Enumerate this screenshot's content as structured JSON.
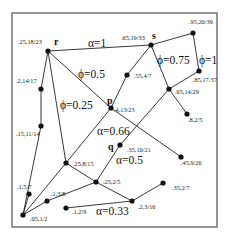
{
  "diagram": {
    "frame": {
      "x": 12,
      "y": 13,
      "width": 205,
      "height": 214
    },
    "nodes": [
      {
        "id": "r",
        "x": 48,
        "y": 51,
        "value": ".25,18/23",
        "name": "r",
        "lx": 18,
        "ly": 44
      },
      {
        "id": "s",
        "x": 151,
        "y": 45,
        "value": ".65,19/33",
        "name": "s",
        "lx": 121,
        "ly": 40
      },
      {
        "id": "n95",
        "x": 193,
        "y": 33,
        "value": ".95,20/39",
        "name": "",
        "lx": 189,
        "ly": 24
      },
      {
        "id": "n85",
        "x": 199,
        "y": 71,
        "value": ".85,17/37",
        "name": "",
        "lx": 193,
        "ly": 82
      },
      {
        "id": "n55",
        "x": 127,
        "y": 75,
        "value": ".55,4/7",
        "name": "",
        "lx": 134,
        "ly": 78
      },
      {
        "id": "n65",
        "x": 169,
        "y": 89,
        "value": ".65,14/29",
        "name": "",
        "lx": 175,
        "ly": 94
      },
      {
        "id": "n8",
        "x": 187,
        "y": 114,
        "value": ".8,2/5",
        "name": "",
        "lx": 188,
        "ly": 122
      },
      {
        "id": "p",
        "x": 111,
        "y": 108,
        "value": ".4,13/23",
        "name": "p",
        "lx": 114,
        "ly": 112
      },
      {
        "id": "n2",
        "x": 41,
        "y": 89,
        "value": ".2,14/17",
        "name": "",
        "lx": 16,
        "ly": 83
      },
      {
        "id": "n15",
        "x": 41,
        "y": 126,
        "value": ".15,11/14",
        "name": "",
        "lx": 16,
        "ly": 136
      },
      {
        "id": "q",
        "x": 120,
        "y": 145,
        "value": ".35,10/21",
        "name": "q",
        "lx": 127,
        "ly": 152
      },
      {
        "id": "n45",
        "x": 181,
        "y": 157,
        "value": ".45,9/26",
        "name": "",
        "lx": 181,
        "ly": 165
      },
      {
        "id": "n258",
        "x": 66,
        "y": 163,
        "value": ".25,8/15",
        "name": "",
        "lx": 73,
        "ly": 166
      },
      {
        "id": "n252",
        "x": 96,
        "y": 182,
        "value": ".25,2/5",
        "name": "",
        "lx": 103,
        "ly": 184
      },
      {
        "id": "n35",
        "x": 163,
        "y": 183,
        "value": ".35,2/7",
        "name": "",
        "lx": 172,
        "ly": 190
      },
      {
        "id": "n15b",
        "x": 29,
        "y": 194,
        "value": ".1,5/7",
        "name": "",
        "lx": 17,
        "ly": 189
      },
      {
        "id": "n13",
        "x": 47,
        "y": 201,
        "value": ".1,3/8",
        "name": "",
        "lx": 51,
        "ly": 196
      },
      {
        "id": "n12",
        "x": 66,
        "y": 208,
        "value": ".1,2/9",
        "name": "",
        "lx": 72,
        "ly": 214
      },
      {
        "id": "n23",
        "x": 132,
        "y": 201,
        "value": ".2,3/16",
        "name": "",
        "lx": 138,
        "ly": 209
      },
      {
        "id": "n05",
        "x": 23,
        "y": 215,
        "value": ".05,1/2",
        "name": "",
        "lx": 30,
        "ly": 221
      }
    ],
    "node_names": {
      "r": {
        "text": "r",
        "x": 54,
        "y": 45
      },
      "s": {
        "text": "s",
        "x": 152,
        "y": 39
      },
      "p": {
        "text": "p",
        "x": 107,
        "y": 104
      },
      "q": {
        "text": "q",
        "x": 108,
        "y": 150
      }
    },
    "edges": [
      [
        "r",
        "s"
      ],
      [
        "s",
        "n95"
      ],
      [
        "n95",
        "n85"
      ],
      [
        "n85",
        "n65"
      ],
      [
        "s",
        "n65"
      ],
      [
        "n65",
        "n8"
      ],
      [
        "s",
        "n55"
      ],
      [
        "n55",
        "p"
      ],
      [
        "p",
        "n258"
      ],
      [
        "n258",
        "n05"
      ],
      [
        "r",
        "p"
      ],
      [
        "p",
        "n45"
      ],
      [
        "r",
        "n2"
      ],
      [
        "n2",
        "n15"
      ],
      [
        "n15",
        "n05"
      ],
      [
        "r",
        "n258"
      ],
      [
        "n65",
        "q"
      ],
      [
        "q",
        "n252"
      ],
      [
        "n252",
        "n13"
      ],
      [
        "n13",
        "n05"
      ],
      [
        "n258",
        "n252"
      ],
      [
        "n252",
        "n23"
      ],
      [
        "n23",
        "n35"
      ],
      [
        "n12",
        "n23"
      ],
      [
        "n05",
        "n15b"
      ]
    ],
    "edge_labels": [
      {
        "text": "α=1",
        "x": 88,
        "y": 47
      },
      {
        "text": "ϕ=0.5",
        "x": 78,
        "y": 78
      },
      {
        "text": "ϕ=0.25",
        "x": 60,
        "y": 109
      },
      {
        "text": "ϕ=0.75",
        "x": 157,
        "y": 64
      },
      {
        "text": "ϕ=1",
        "x": 199,
        "y": 64
      },
      {
        "text": "α=0.66",
        "x": 97,
        "y": 135
      },
      {
        "text": "α=0.5",
        "x": 116,
        "y": 164
      },
      {
        "text": "α=0.33",
        "x": 96,
        "y": 215
      }
    ]
  }
}
